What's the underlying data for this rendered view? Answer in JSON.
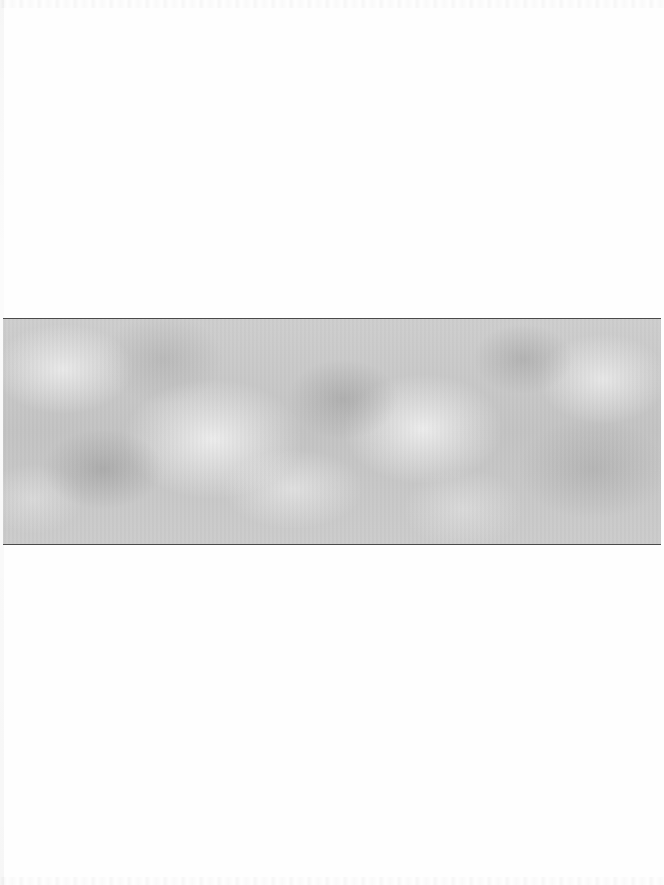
{
  "page": {
    "type": "scanned-page",
    "background_color": "#fefefe"
  },
  "band": {
    "description": "gray cloud texture band",
    "base_color": "#c9c9c9",
    "border_color": "#4a4a4a",
    "top_px": 318,
    "height_px": 225
  },
  "text_content": []
}
